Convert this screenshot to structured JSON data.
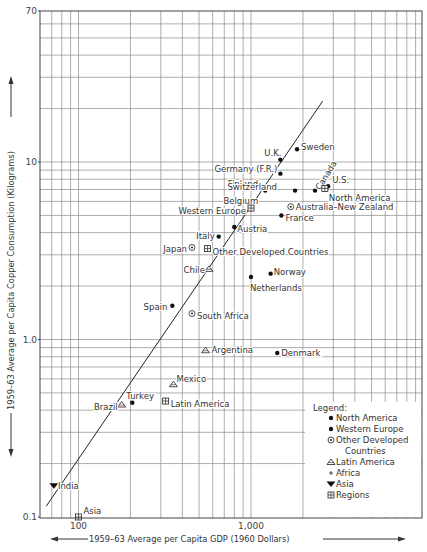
{
  "chart_data": {
    "type": "scatter",
    "title": "",
    "xlabel": "1959–63 Average per Capita GDP (1960 Dollars)",
    "ylabel": "1959–63 Average per Capita Copper Consumption (Kilograms)",
    "xscale": "log",
    "yscale": "log",
    "xlim": [
      60,
      10000
    ],
    "ylim": [
      0.1,
      70
    ],
    "x_tick_labels": [
      {
        "value": 100,
        "label": "100"
      },
      {
        "value": 1000,
        "label": "1,000"
      }
    ],
    "y_tick_labels": [
      {
        "value": 0.1,
        "label": "0.1"
      },
      {
        "value": 1.0,
        "label": "1.0"
      },
      {
        "value": 10,
        "label": "10"
      },
      {
        "value": 70,
        "label": "70"
      }
    ],
    "grid": true,
    "legend_position": "lower right",
    "legend": {
      "title": "Legend:",
      "entries": [
        {
          "marker": "dot",
          "label": "North America"
        },
        {
          "marker": "dot",
          "label": "Western Europe"
        },
        {
          "marker": "circle-dot",
          "label": "Other Developed Countries"
        },
        {
          "marker": "triangle",
          "label": "Latin America"
        },
        {
          "marker": "plus",
          "label": "Africa"
        },
        {
          "marker": "triangle-down",
          "label": "Asia"
        },
        {
          "marker": "boxed-plus",
          "label": "Regions"
        }
      ]
    },
    "regression_line": {
      "x": [
        65,
        2600
      ],
      "y": [
        0.115,
        22
      ]
    },
    "points": [
      {
        "label": "Sweden",
        "group": "Western Europe",
        "marker": "dot",
        "x": 1850,
        "y": 11.8,
        "lx": 4,
        "ly": -2,
        "anchor": "start"
      },
      {
        "label": "U.K.",
        "group": "Western Europe",
        "marker": "dot",
        "x": 1480,
        "y": 10.3,
        "lx": -16,
        "ly": -7,
        "anchor": "start"
      },
      {
        "label": "Germany (F.R.)",
        "group": "Western Europe",
        "marker": "dot",
        "x": 1480,
        "y": 8.6,
        "lx": -3,
        "ly": -5,
        "anchor": "end"
      },
      {
        "label": "Finland",
        "group": "Western Europe",
        "marker": "dot",
        "x": 1160,
        "y": 7.2,
        "lx": -4,
        "ly": -3,
        "anchor": "end"
      },
      {
        "label": "Belgium",
        "group": "Western Europe",
        "marker": "dot",
        "x": 1210,
        "y": 6.9,
        "lx": -7,
        "ly": 10,
        "anchor": "end"
      },
      {
        "label": "Switzerland",
        "group": "Western Europe",
        "marker": "dot",
        "x": 1800,
        "y": 6.9,
        "lx": -18,
        "ly": -4,
        "anchor": "end"
      },
      {
        "label": "Canada",
        "group": "North America",
        "marker": "dot",
        "x": 2350,
        "y": 6.9,
        "lx": 5,
        "ly": -3,
        "anchor": "start",
        "rotate": -58
      },
      {
        "label": "U.S.",
        "group": "North America",
        "marker": "dot",
        "x": 2800,
        "y": 7.3,
        "lx": 4,
        "ly": -6,
        "anchor": "start"
      },
      {
        "label": "North America",
        "group": "Regions",
        "marker": "boxed-plus",
        "x": 2680,
        "y": 7.1,
        "lx": 4,
        "ly": 10,
        "anchor": "start"
      },
      {
        "label": "Western Europe",
        "group": "Regions",
        "marker": "boxed-plus",
        "x": 1000,
        "y": 5.5,
        "lx": -5,
        "ly": 3,
        "anchor": "end"
      },
      {
        "label": "Australia–New Zealand",
        "group": "Other Developed Countries",
        "marker": "circle-dot",
        "x": 1700,
        "y": 5.6,
        "lx": 5,
        "ly": 0,
        "anchor": "start"
      },
      {
        "label": "France",
        "group": "Western Europe",
        "marker": "dot",
        "x": 1500,
        "y": 5.0,
        "lx": 4,
        "ly": 3,
        "anchor": "start"
      },
      {
        "label": "Austria",
        "group": "Western Europe",
        "marker": "dot",
        "x": 800,
        "y": 4.3,
        "lx": 3,
        "ly": 2,
        "anchor": "start"
      },
      {
        "label": "Italy",
        "group": "Western Europe",
        "marker": "dot",
        "x": 650,
        "y": 3.8,
        "lx": -4,
        "ly": -1,
        "anchor": "end"
      },
      {
        "label": "Japan",
        "group": "Other Developed Countries",
        "marker": "circle-dot",
        "x": 455,
        "y": 3.3,
        "lx": -5,
        "ly": 2,
        "anchor": "end"
      },
      {
        "label": "Other Developed Countries",
        "group": "Regions",
        "marker": "boxed-plus",
        "x": 560,
        "y": 3.25,
        "lx": 5,
        "ly": 3,
        "anchor": "start"
      },
      {
        "label": "Chile",
        "group": "Latin America",
        "marker": "triangle",
        "x": 570,
        "y": 2.5,
        "lx": -4,
        "ly": 1,
        "anchor": "end"
      },
      {
        "label": "Netherlands",
        "group": "Western Europe",
        "marker": "dot",
        "x": 1000,
        "y": 2.25,
        "lx": -1,
        "ly": 11,
        "anchor": "start"
      },
      {
        "label": "Norway",
        "group": "Western Europe",
        "marker": "dot",
        "x": 1300,
        "y": 2.35,
        "lx": 3,
        "ly": -2,
        "anchor": "start"
      },
      {
        "label": "Spain",
        "group": "Western Europe",
        "marker": "dot",
        "x": 350,
        "y": 1.55,
        "lx": -5,
        "ly": 1,
        "anchor": "end"
      },
      {
        "label": "South Africa",
        "group": "Africa",
        "marker": "circle-dot",
        "x": 455,
        "y": 1.4,
        "lx": 5,
        "ly": 2,
        "anchor": "start"
      },
      {
        "label": "Argentina",
        "group": "Latin America",
        "marker": "triangle",
        "x": 545,
        "y": 0.87,
        "lx": 6,
        "ly": 0,
        "anchor": "start"
      },
      {
        "label": "Denmark",
        "group": "Western Europe",
        "marker": "dot",
        "x": 1420,
        "y": 0.84,
        "lx": 4,
        "ly": 0,
        "anchor": "start"
      },
      {
        "label": "Mexico",
        "group": "Latin America",
        "marker": "triangle",
        "x": 355,
        "y": 0.56,
        "lx": 3,
        "ly": -5,
        "anchor": "start"
      },
      {
        "label": "Latin America",
        "group": "Regions",
        "marker": "boxed-plus",
        "x": 320,
        "y": 0.45,
        "lx": 5,
        "ly": 3,
        "anchor": "start"
      },
      {
        "label": "Turkey",
        "group": "Western Europe",
        "marker": "dot",
        "x": 205,
        "y": 0.44,
        "lx": -6,
        "ly": -7,
        "anchor": "start"
      },
      {
        "label": "Brazil",
        "group": "Latin America",
        "marker": "triangle",
        "x": 178,
        "y": 0.43,
        "lx": -4,
        "ly": 2,
        "anchor": "end"
      },
      {
        "label": "India",
        "group": "Asia",
        "marker": "triangle-down",
        "x": 72,
        "y": 0.15,
        "lx": 4,
        "ly": 0,
        "anchor": "start"
      },
      {
        "label": "Asia",
        "group": "Regions",
        "marker": "boxed-plus",
        "x": 100,
        "y": 0.1,
        "lx": 5,
        "ly": -6,
        "anchor": "start"
      }
    ]
  }
}
